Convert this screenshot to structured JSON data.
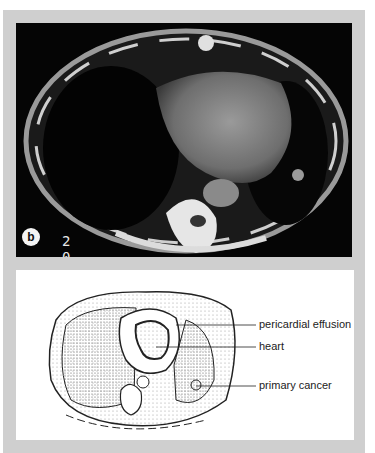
{
  "figure": {
    "panel_label": "b",
    "scan_overlay": {
      "numbers": [
        "2",
        "0",
        "1 2 0"
      ],
      "corner_mark": "V"
    },
    "diagram_labels": [
      {
        "id": "pericardial-effusion",
        "text": "pericardial effusion"
      },
      {
        "id": "heart",
        "text": "heart"
      },
      {
        "id": "primary-cancer",
        "text": "primary cancer"
      }
    ]
  }
}
